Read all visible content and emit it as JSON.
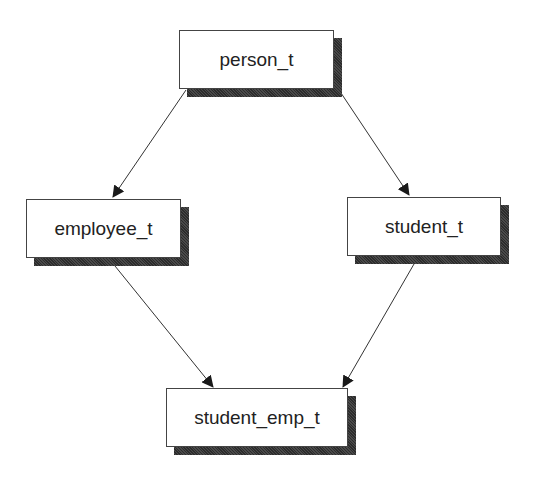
{
  "diagram": {
    "type": "inheritance-diamond",
    "nodes": [
      {
        "id": "person",
        "label": "person_t",
        "x": 179,
        "y": 30,
        "w": 155,
        "h": 59
      },
      {
        "id": "employee",
        "label": "employee_t",
        "x": 26,
        "y": 199,
        "w": 155,
        "h": 59
      },
      {
        "id": "student",
        "label": "student_t",
        "x": 347,
        "y": 197,
        "w": 154,
        "h": 59
      },
      {
        "id": "student_emp",
        "label": "student_emp_t",
        "x": 166,
        "y": 388,
        "w": 182,
        "h": 59
      }
    ],
    "edges": [
      {
        "from": "person",
        "to": "employee"
      },
      {
        "from": "person",
        "to": "student"
      },
      {
        "from": "employee",
        "to": "student_emp"
      },
      {
        "from": "student",
        "to": "student_emp"
      }
    ],
    "colors": {
      "line": "#333333",
      "border": "#444444",
      "shadow": "#3a3a3a"
    }
  }
}
